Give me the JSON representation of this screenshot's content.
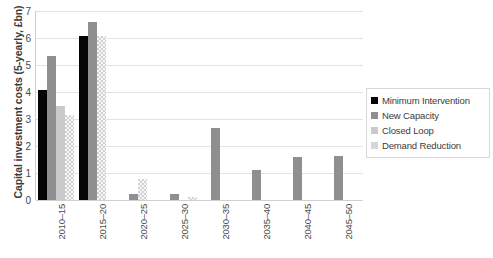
{
  "chart_data": {
    "type": "bar",
    "title": "",
    "xlabel": "",
    "ylabel": "Capital investment costs (5-yearly, £bn)",
    "ylim": [
      0,
      7
    ],
    "yticks": [
      0,
      1,
      2,
      3,
      4,
      5,
      6,
      7
    ],
    "ytick_labels": [
      "0",
      "1",
      "2",
      "3",
      "4",
      "5",
      "6",
      "7"
    ],
    "grid": true,
    "legend_position": "right",
    "categories": [
      "2010–15",
      "2015–20",
      "2020–25",
      "2025–30",
      "2030–35",
      "2035–40",
      "2040–45",
      "2045–50"
    ],
    "series": [
      {
        "name": "Minimum Intervention",
        "color": "#050505",
        "values": [
          4.07,
          6.06,
          0,
          0,
          0,
          0,
          0,
          0
        ]
      },
      {
        "name": "New Capacity",
        "color": "#8f8f8f",
        "values": [
          5.33,
          6.6,
          0.22,
          0.21,
          2.67,
          1.13,
          1.58,
          1.63
        ]
      },
      {
        "name": "Closed Loop",
        "color": "#cacaca",
        "values": [
          3.47,
          6.06,
          0.77,
          0,
          0,
          0,
          0,
          0
        ]
      },
      {
        "name": "Demand Reduction",
        "color": "#d6d6d6",
        "values": [
          3.14,
          0,
          0,
          0.12,
          0,
          0,
          0,
          0
        ]
      }
    ]
  },
  "legend": {
    "items": [
      {
        "label": "Minimum Intervention"
      },
      {
        "label": "New Capacity"
      },
      {
        "label": "Closed Loop"
      },
      {
        "label": "Demand Reduction"
      }
    ]
  }
}
